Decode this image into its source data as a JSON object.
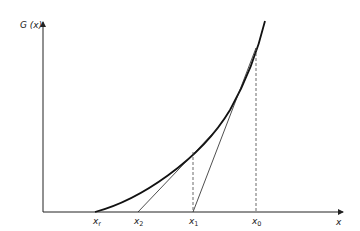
{
  "figure": {
    "y_axis_label": "G (x)",
    "x_axis_label": "x",
    "points": [
      {
        "name": "x_r",
        "base": "x",
        "sub": "r"
      },
      {
        "name": "x_2",
        "base": "x",
        "sub": "2"
      },
      {
        "name": "x_1",
        "base": "x",
        "sub": "1"
      },
      {
        "name": "x_0",
        "base": "x",
        "sub": "0"
      }
    ]
  }
}
